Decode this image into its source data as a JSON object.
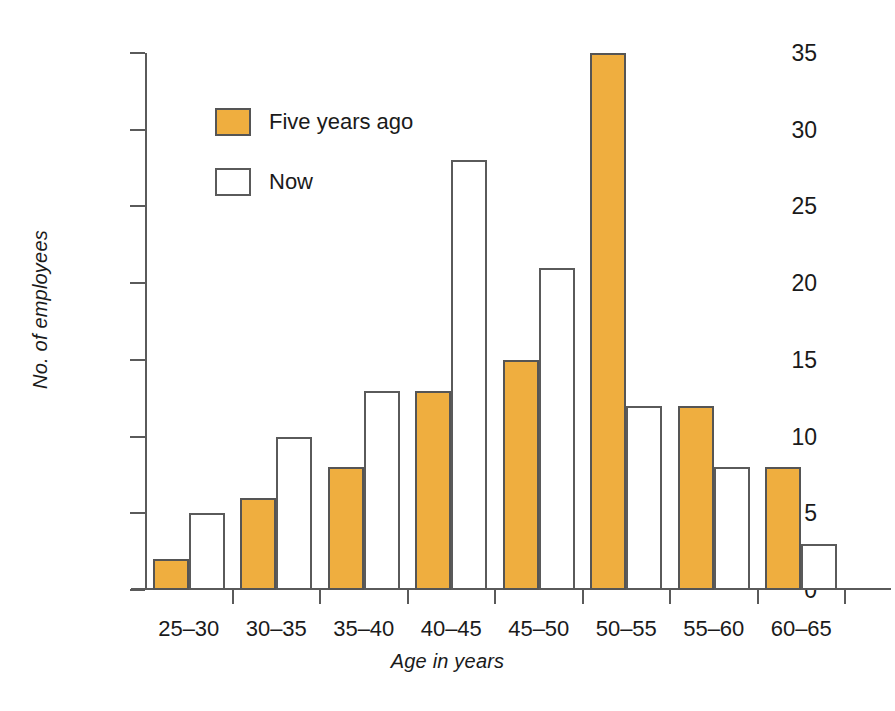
{
  "chart_data": {
    "type": "bar",
    "title": "",
    "xlabel": "Age in years",
    "ylabel": "No. of employees",
    "categories": [
      "25–30",
      "30–35",
      "35–40",
      "40–45",
      "45–50",
      "50–55",
      "55–60",
      "60–65"
    ],
    "series": [
      {
        "name": "Five years ago",
        "color": "#EFAE3F",
        "values": [
          2,
          6,
          8,
          13,
          15,
          35,
          12,
          8
        ]
      },
      {
        "name": "Now",
        "color": "#FFFFFF",
        "values": [
          5,
          10,
          13,
          28,
          21,
          12,
          8,
          3
        ]
      }
    ],
    "ylim": [
      0,
      35
    ],
    "yticks": [
      0,
      5,
      10,
      15,
      20,
      25,
      30,
      35
    ],
    "ytick_labels": [
      "0",
      "5",
      "10",
      "15",
      "20",
      "25",
      "30",
      "35"
    ],
    "grid": false,
    "legend_position": "upper-left-inside",
    "axis_color": "#5A5A5A",
    "bar_outline_color": "#555555"
  },
  "legend": {
    "items": [
      {
        "label": "Five years ago",
        "swatch": "orange"
      },
      {
        "label": "Now",
        "swatch": "white"
      }
    ]
  }
}
